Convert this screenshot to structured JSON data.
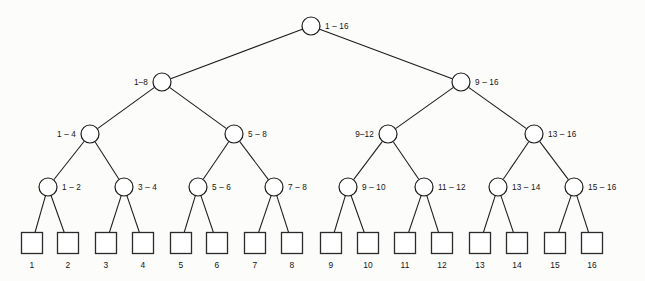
{
  "diagram": {
    "colors": {
      "background": "#fcfcfb",
      "stroke": "#1b1b1b",
      "node_fill": "#ffffff",
      "text": "#141414"
    },
    "geometry": {
      "width": 645,
      "height": 281,
      "node_radius": 9,
      "leaf_size": 21
    },
    "levels": [
      {
        "level": 0,
        "y": 26,
        "nodes": [
          {
            "id": "n1-16",
            "label": "1 – 16",
            "cx": 311,
            "cy": 26,
            "label_side": "right"
          }
        ]
      },
      {
        "level": 1,
        "y": 82,
        "nodes": [
          {
            "id": "n1-8",
            "label": "1–8",
            "cx": 162,
            "cy": 82,
            "label_side": "left"
          },
          {
            "id": "n9-16",
            "label": "9 – 16",
            "cx": 461,
            "cy": 82,
            "label_side": "right"
          }
        ]
      },
      {
        "level": 2,
        "y": 134,
        "nodes": [
          {
            "id": "n1-4",
            "label": "1 – 4",
            "cx": 90,
            "cy": 134,
            "label_side": "left"
          },
          {
            "id": "n5-8",
            "label": "5 – 8",
            "cx": 234,
            "cy": 134,
            "label_side": "right"
          },
          {
            "id": "n9-12",
            "label": "9–12",
            "cx": 388,
            "cy": 134,
            "label_side": "left"
          },
          {
            "id": "n13-16",
            "label": "13 – 16",
            "cx": 534,
            "cy": 134,
            "label_side": "right"
          }
        ]
      },
      {
        "level": 3,
        "y": 187,
        "nodes": [
          {
            "id": "n1-2",
            "label": "1 – 2",
            "cx": 48,
            "cy": 187,
            "label_side": "right"
          },
          {
            "id": "n3-4",
            "label": "3 – 4",
            "cx": 124,
            "cy": 187,
            "label_side": "right"
          },
          {
            "id": "n5-6",
            "label": "5 – 6",
            "cx": 198,
            "cy": 187,
            "label_side": "right"
          },
          {
            "id": "n7-8",
            "label": "7 – 8",
            "cx": 274,
            "cy": 187,
            "label_side": "right"
          },
          {
            "id": "n9-10",
            "label": "9 – 10",
            "cx": 348,
            "cy": 187,
            "label_side": "right"
          },
          {
            "id": "n11-12",
            "label": "11 – 12",
            "cx": 424,
            "cy": 187,
            "label_side": "right"
          },
          {
            "id": "n13-14",
            "label": "13 – 14",
            "cx": 498,
            "cy": 187,
            "label_side": "right"
          },
          {
            "id": "n15-16",
            "label": "15 – 16",
            "cx": 574,
            "cy": 187,
            "label_side": "right"
          }
        ]
      }
    ],
    "leaves": [
      {
        "id": "leaf-1",
        "label": "1",
        "cx": 32,
        "cy": 243
      },
      {
        "id": "leaf-2",
        "label": "2",
        "cx": 68,
        "cy": 243
      },
      {
        "id": "leaf-3",
        "label": "3",
        "cx": 106,
        "cy": 243
      },
      {
        "id": "leaf-4",
        "label": "4",
        "cx": 143,
        "cy": 243
      },
      {
        "id": "leaf-5",
        "label": "5",
        "cx": 181,
        "cy": 243
      },
      {
        "id": "leaf-6",
        "label": "6",
        "cx": 217,
        "cy": 243
      },
      {
        "id": "leaf-7",
        "label": "7",
        "cx": 255,
        "cy": 243
      },
      {
        "id": "leaf-8",
        "label": "8",
        "cx": 292,
        "cy": 243
      },
      {
        "id": "leaf-9",
        "label": "9",
        "cx": 331,
        "cy": 243
      },
      {
        "id": "leaf-10",
        "label": "10",
        "cx": 368,
        "cy": 243
      },
      {
        "id": "leaf-11",
        "label": "11",
        "cx": 405,
        "cy": 243
      },
      {
        "id": "leaf-12",
        "label": "12",
        "cx": 442,
        "cy": 243
      },
      {
        "id": "leaf-13",
        "label": "13",
        "cx": 480,
        "cy": 243
      },
      {
        "id": "leaf-14",
        "label": "14",
        "cx": 517,
        "cy": 243
      },
      {
        "id": "leaf-15",
        "label": "15",
        "cx": 555,
        "cy": 243
      },
      {
        "id": "leaf-16",
        "label": "16",
        "cx": 592,
        "cy": 243
      }
    ],
    "leaf_label_y": 268,
    "edges": [
      {
        "from": "n1-16",
        "to": "n1-8"
      },
      {
        "from": "n1-16",
        "to": "n9-16"
      },
      {
        "from": "n1-8",
        "to": "n1-4"
      },
      {
        "from": "n1-8",
        "to": "n5-8"
      },
      {
        "from": "n9-16",
        "to": "n9-12"
      },
      {
        "from": "n9-16",
        "to": "n13-16"
      },
      {
        "from": "n1-4",
        "to": "n1-2"
      },
      {
        "from": "n1-4",
        "to": "n3-4"
      },
      {
        "from": "n5-8",
        "to": "n5-6"
      },
      {
        "from": "n5-8",
        "to": "n7-8"
      },
      {
        "from": "n9-12",
        "to": "n9-10"
      },
      {
        "from": "n9-12",
        "to": "n11-12"
      },
      {
        "from": "n13-16",
        "to": "n13-14"
      },
      {
        "from": "n13-16",
        "to": "n15-16"
      },
      {
        "from": "n1-2",
        "to": "leaf-1"
      },
      {
        "from": "n1-2",
        "to": "leaf-2"
      },
      {
        "from": "n3-4",
        "to": "leaf-3"
      },
      {
        "from": "n3-4",
        "to": "leaf-4"
      },
      {
        "from": "n5-6",
        "to": "leaf-5"
      },
      {
        "from": "n5-6",
        "to": "leaf-6"
      },
      {
        "from": "n7-8",
        "to": "leaf-7"
      },
      {
        "from": "n7-8",
        "to": "leaf-8"
      },
      {
        "from": "n9-10",
        "to": "leaf-9"
      },
      {
        "from": "n9-10",
        "to": "leaf-10"
      },
      {
        "from": "n11-12",
        "to": "leaf-11"
      },
      {
        "from": "n11-12",
        "to": "leaf-12"
      },
      {
        "from": "n13-14",
        "to": "leaf-13"
      },
      {
        "from": "n13-14",
        "to": "leaf-14"
      },
      {
        "from": "n15-16",
        "to": "leaf-15"
      },
      {
        "from": "n15-16",
        "to": "leaf-16"
      }
    ]
  }
}
